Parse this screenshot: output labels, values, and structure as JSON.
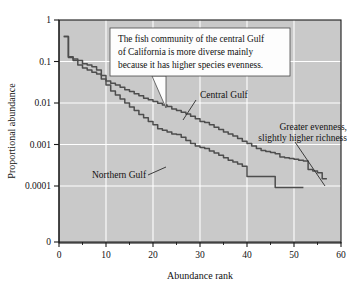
{
  "chart_data": {
    "type": "line",
    "title": "",
    "xlabel": "Abundance rank",
    "ylabel": "Proportional abundance",
    "xlim": [
      0,
      60
    ],
    "yscale": "log",
    "ylim": [
      0.0001,
      1
    ],
    "grid": true,
    "legend_position": "inline-annotations",
    "xticks": [
      0,
      10,
      20,
      30,
      40,
      50,
      60
    ],
    "xticklabels": [
      "0",
      "10",
      "20",
      "30",
      "40",
      "50",
      "60"
    ],
    "xminorticks": [
      5,
      15,
      25,
      35,
      45,
      55
    ],
    "yticks": [
      1,
      0.1,
      0.01,
      0.001,
      0.0001,
      0
    ],
    "yticklabels": [
      "1",
      "0.1",
      "0.01",
      "0.001",
      "0.0001",
      "0"
    ],
    "plot_bgcolor": "#c9c9c9",
    "gridcolor": "#ffffff",
    "linecolor": "#4d4d4d",
    "series": [
      {
        "name": "Central Gulf",
        "x": [
          1,
          2,
          3,
          4,
          5,
          6,
          7,
          8,
          9,
          10,
          11,
          12,
          13,
          14,
          15,
          16,
          17,
          18,
          19,
          20,
          21,
          22,
          23,
          24,
          25,
          26,
          27,
          28,
          29,
          30,
          31,
          32,
          33,
          34,
          35,
          36,
          37,
          38,
          39,
          40,
          41,
          42,
          43,
          44,
          45,
          46,
          47,
          48,
          49,
          50,
          51,
          52,
          53,
          54,
          55,
          56,
          57
        ],
        "values": [
          0.4,
          0.125,
          0.115,
          0.105,
          0.088,
          0.082,
          0.075,
          0.062,
          0.046,
          0.034,
          0.03,
          0.027,
          0.024,
          0.021,
          0.019,
          0.0168,
          0.015,
          0.013,
          0.012,
          0.0108,
          0.0098,
          0.009,
          0.0082,
          0.0072,
          0.0066,
          0.006,
          0.0054,
          0.0048,
          0.0042,
          0.0036,
          0.0034,
          0.003,
          0.0026,
          0.0023,
          0.002,
          0.0018,
          0.0016,
          0.0014,
          0.0012,
          0.00105,
          0.00092,
          0.0008,
          0.00072,
          0.00068,
          0.00064,
          0.0006,
          0.0005,
          0.00048,
          0.00046,
          0.00044,
          0.00042,
          0.0004,
          0.00025,
          0.00023,
          0.00021,
          0.00015,
          0.00015
        ]
      },
      {
        "name": "Northern Gulf",
        "x": [
          1,
          2,
          3,
          4,
          5,
          6,
          7,
          8,
          9,
          10,
          11,
          12,
          13,
          14,
          15,
          16,
          17,
          18,
          19,
          20,
          21,
          22,
          23,
          24,
          25,
          26,
          27,
          28,
          29,
          30,
          31,
          32,
          33,
          34,
          35,
          36,
          37,
          38,
          39,
          40,
          41,
          42,
          43,
          44,
          45,
          46,
          47,
          48,
          49,
          50,
          51,
          52
        ],
        "values": [
          0.4,
          0.13,
          0.105,
          0.082,
          0.07,
          0.062,
          0.055,
          0.05,
          0.038,
          0.027,
          0.0195,
          0.0155,
          0.0125,
          0.01,
          0.008,
          0.0066,
          0.0053,
          0.0044,
          0.0036,
          0.003,
          0.0024,
          0.0022,
          0.002,
          0.0018,
          0.00175,
          0.0015,
          0.00125,
          0.00105,
          0.00092,
          0.00085,
          0.0008,
          0.0007,
          0.00062,
          0.00055,
          0.00048,
          0.00042,
          0.00038,
          0.00034,
          0.0003,
          0.00017,
          0.00017,
          0.00017,
          0.00017,
          0.00017,
          0.00017,
          9.2e-05,
          9.2e-05,
          9.2e-05,
          9.2e-05,
          9.2e-05,
          9.2e-05,
          9.2e-05
        ]
      }
    ],
    "annotations": [
      {
        "id": "central-gulf-label",
        "text": "Central Gulf"
      },
      {
        "id": "northern-gulf-label",
        "text": "Northern Gulf"
      },
      {
        "id": "greater-evenness-line1",
        "text": "Greater evenness,"
      },
      {
        "id": "greater-evenness-line2",
        "text": "slightly higher richness"
      }
    ],
    "callout": {
      "line1": "The fish community of the central Gulf",
      "line2": "of California is more diverse mainly",
      "line3": "because it has higher species evenness."
    }
  }
}
